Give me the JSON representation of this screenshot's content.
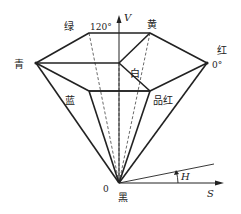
{
  "diagram": {
    "axis_v_label": "V",
    "axis_s_label": "S",
    "angle_h_label": "H",
    "origin_label": "0",
    "angle_120_label": "120°",
    "angle_0_label": "0°",
    "vertices": {
      "green": "绿",
      "yellow": "黄",
      "cyan": "青",
      "red": "红",
      "white": "白",
      "blue": "蓝",
      "magenta": "品红",
      "black": "黑"
    }
  }
}
